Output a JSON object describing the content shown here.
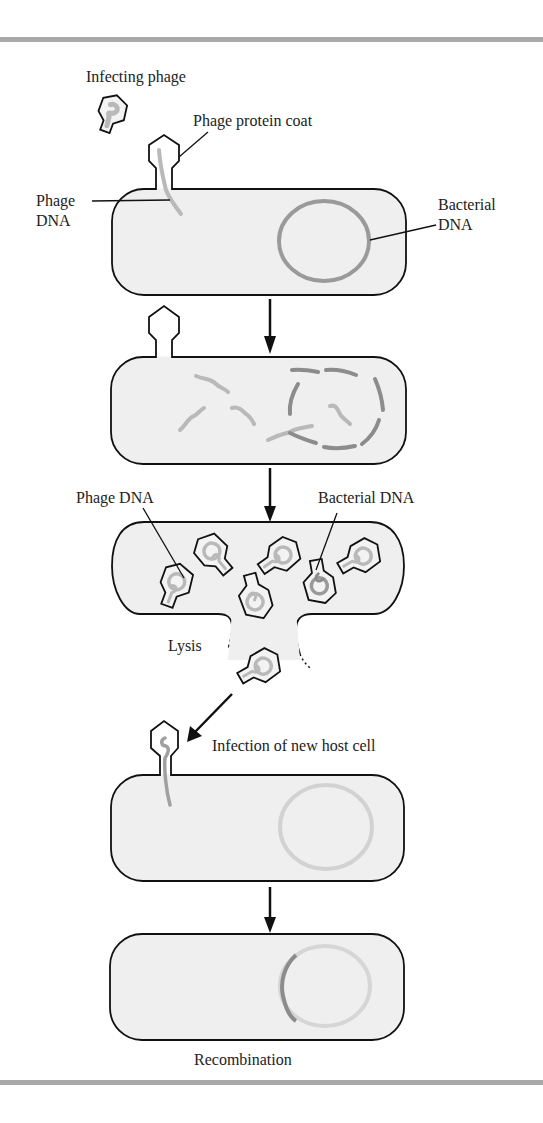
{
  "figure": {
    "stages": [
      {
        "id": "infection",
        "labels": {
          "infecting_phage": "Infecting phage",
          "phage_protein_coat": "Phage protein coat",
          "phage_dna": "Phage DNA",
          "bacterial_dna": "Bacterial DNA"
        }
      },
      {
        "id": "dna_fragmentation",
        "labels": {}
      },
      {
        "id": "phage_assembly",
        "labels": {
          "phage_dna": "Phage DNA",
          "bacterial_dna": "Bacterial DNA",
          "lysis": "Lysis"
        }
      },
      {
        "id": "new_infection",
        "labels": {
          "infection_new_host": "Infection of new host cell"
        }
      },
      {
        "id": "recombination",
        "labels": {
          "recombination": "Recombination"
        }
      }
    ],
    "colors": {
      "cell_fill": "#efefef",
      "outline": "#111111",
      "phage_dna": "#b9b9b9",
      "bacterial_dna": "#8c8c8c",
      "rule": "#a9a9a9"
    }
  }
}
